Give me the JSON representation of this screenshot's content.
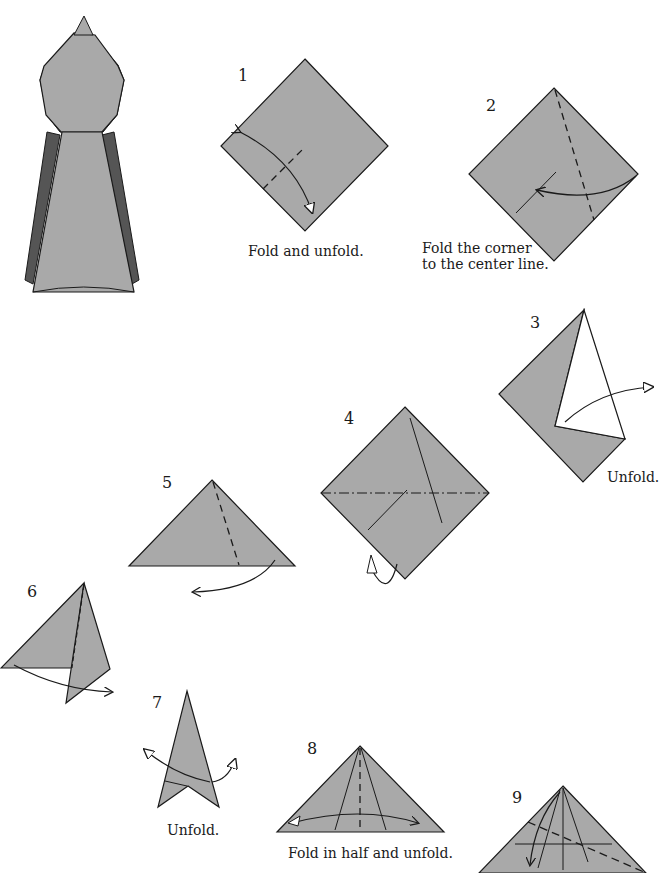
{
  "colors": {
    "paper": "#a9a9a9",
    "paper_dark": "#555555",
    "line": "#1a1a1a",
    "background": "#ffffff"
  },
  "final_model": {
    "name": "finished-model"
  },
  "steps": [
    {
      "number": "1",
      "caption": "Fold and unfold."
    },
    {
      "number": "2",
      "caption_line1": "Fold the corner",
      "caption_line2": "to the center line."
    },
    {
      "number": "3",
      "caption": "Unfold."
    },
    {
      "number": "4",
      "caption": ""
    },
    {
      "number": "5",
      "caption": ""
    },
    {
      "number": "6",
      "caption": ""
    },
    {
      "number": "7",
      "caption": "Unfold."
    },
    {
      "number": "8",
      "caption": "Fold in half and unfold."
    },
    {
      "number": "9",
      "caption": ""
    }
  ]
}
